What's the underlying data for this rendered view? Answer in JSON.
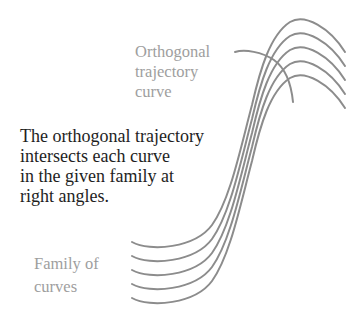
{
  "colors": {
    "curve": "#8c8c8c",
    "label": "#9e9e9e",
    "main_text": "#1e1e1e",
    "background": "#ffffff"
  },
  "labels": {
    "orthogonal_trajectory": {
      "lines": [
        "Orthogonal",
        "trajectory",
        "curve"
      ]
    },
    "family_of_curves": {
      "lines": [
        "Family of",
        "curves"
      ]
    }
  },
  "description": {
    "lines": [
      "The orthogonal trajectory",
      "intersects each curve",
      "in the given family at",
      "right angles."
    ]
  },
  "figure": {
    "family_curve_count": 5,
    "family_curve_offset_y": 14,
    "trajectory_curve_count": 1
  }
}
